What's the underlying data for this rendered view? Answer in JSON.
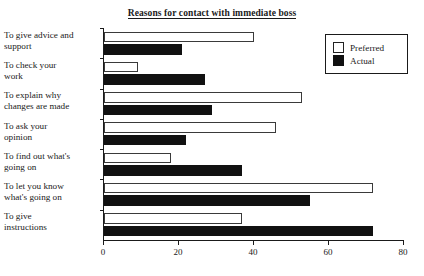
{
  "chart_data": {
    "type": "bar",
    "orientation": "horizontal",
    "title": "Reasons for contact with immediate boss",
    "xlabel": "",
    "ylabel": "",
    "xlim": [
      0,
      80
    ],
    "xticks": [
      0,
      20,
      40,
      60,
      80
    ],
    "grid": false,
    "legend_position": "top-right",
    "categories": [
      "To give advice and support",
      "To check your work",
      "To explain why changes are made",
      "To ask your opinion",
      "To find out what's going on",
      "To let you know what's going on",
      "To give instructions"
    ],
    "category_lines": [
      [
        "To give advice and",
        "support"
      ],
      [
        "To check your",
        "work"
      ],
      [
        "To explain why",
        "changes are made"
      ],
      [
        "To ask your",
        "opinion"
      ],
      [
        "To find out what's",
        "going on"
      ],
      [
        "To let you know",
        "what's going on"
      ],
      [
        "To give",
        "instructions"
      ]
    ],
    "series": [
      {
        "name": "Preferred",
        "color": "#ffffff",
        "values": [
          40,
          9,
          53,
          46,
          18,
          72,
          37
        ]
      },
      {
        "name": "Actual",
        "color": "#111111",
        "values": [
          21,
          27,
          29,
          22,
          37,
          55,
          72
        ]
      }
    ]
  }
}
